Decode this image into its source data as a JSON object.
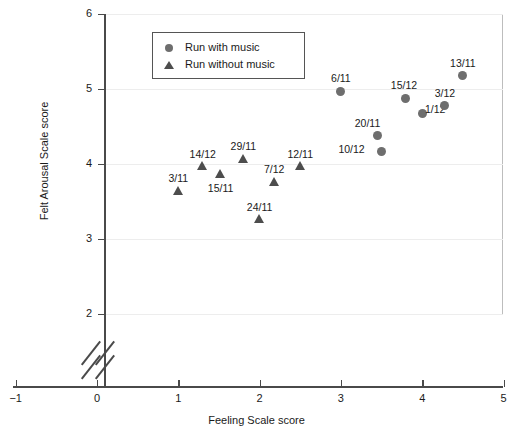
{
  "chart_data": {
    "type": "scatter",
    "title": "",
    "xlabel": "Feeling Scale score",
    "ylabel": "Felt Arousal Scale score",
    "xlim": [
      -1,
      5
    ],
    "ylim": [
      2,
      6
    ],
    "x_ticks": [
      "-1",
      "0",
      "1",
      "2",
      "3",
      "4",
      "5"
    ],
    "y_ticks": [
      "2",
      "3",
      "4",
      "5",
      "6"
    ],
    "grid": "horizontal",
    "y_axis_break": true,
    "legend_position": "top-left",
    "legend": [
      {
        "key": "with_music",
        "label": "Run with music",
        "marker": "circle",
        "color": "#6e6e6e"
      },
      {
        "key": "without_music",
        "label": "Run without music",
        "marker": "triangle",
        "color": "#4d4d4d"
      }
    ],
    "series": [
      {
        "name": "Run with music",
        "marker": "circle",
        "color": "#6e6e6e",
        "points": [
          {
            "label": "6/11",
            "x": 3.0,
            "y": 4.97,
            "lx": -2,
            "ly": -19
          },
          {
            "label": "10/12",
            "x": 3.5,
            "y": 4.17,
            "lx": -32,
            "ly": -8
          },
          {
            "label": "20/11",
            "x": 3.45,
            "y": 4.38,
            "lx": -12,
            "ly": -19
          },
          {
            "label": "15/12",
            "x": 3.8,
            "y": 4.88,
            "lx": -4,
            "ly": -19
          },
          {
            "label": "1/12",
            "x": 4.0,
            "y": 4.67,
            "lx": 11,
            "ly": -11
          },
          {
            "label": "3/12",
            "x": 4.28,
            "y": 4.78,
            "lx": -2,
            "ly": -19
          },
          {
            "label": "13/11",
            "x": 4.5,
            "y": 5.18,
            "lx": -2,
            "ly": -19
          }
        ]
      },
      {
        "name": "Run without music",
        "marker": "triangle",
        "color": "#4d4d4d",
        "points": [
          {
            "label": "3/11",
            "x": 1.0,
            "y": 3.65,
            "lx": -2,
            "ly": -18
          },
          {
            "label": "14/12",
            "x": 1.3,
            "y": 3.98,
            "lx": -2,
            "ly": -18
          },
          {
            "label": "15/11",
            "x": 1.52,
            "y": 3.88,
            "lx": -2,
            "ly": 9
          },
          {
            "label": "29/11",
            "x": 1.8,
            "y": 4.08,
            "lx": -2,
            "ly": -18
          },
          {
            "label": "24/11",
            "x": 2.0,
            "y": 3.27,
            "lx": -2,
            "ly": -18
          },
          {
            "label": "7/12",
            "x": 2.18,
            "y": 3.77,
            "lx": -2,
            "ly": -18
          },
          {
            "label": "12/11",
            "x": 2.5,
            "y": 3.98,
            "lx": -2,
            "ly": -18
          }
        ]
      }
    ]
  }
}
